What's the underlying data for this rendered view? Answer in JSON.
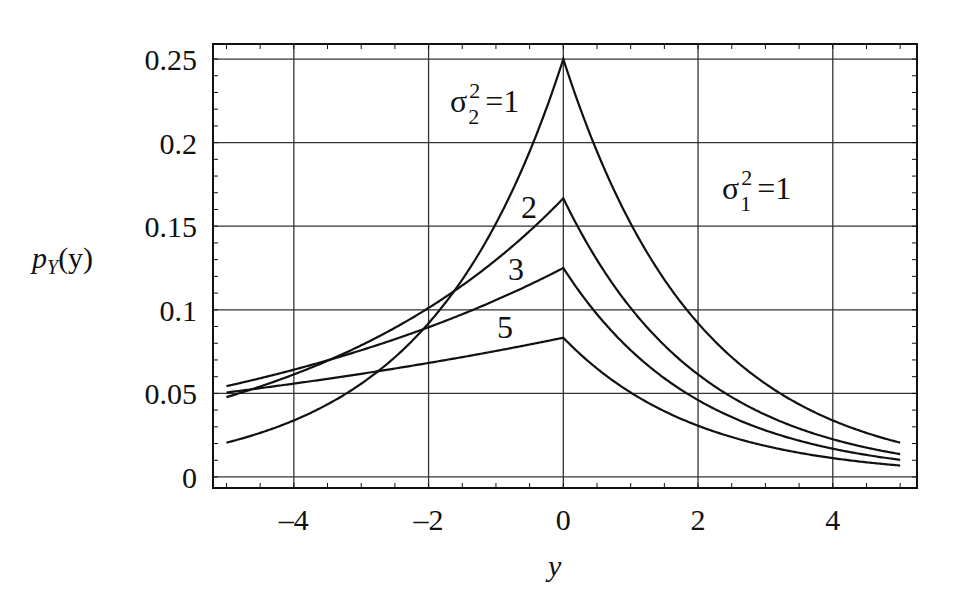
{
  "chart_data": {
    "type": "line",
    "title": "",
    "xlabel": "y",
    "ylabel": "p_Y(y)",
    "xlim": [
      -5.2,
      5.25
    ],
    "ylim": [
      -0.0066,
      0.259
    ],
    "grid": true,
    "x_ticks": [
      -4,
      -2,
      0,
      2,
      4
    ],
    "x_tick_labels": [
      "-4",
      "-2",
      "0",
      "2",
      "4"
    ],
    "y_ticks": [
      0,
      0.05,
      0.1,
      0.15,
      0.2,
      0.25
    ],
    "y_tick_labels": [
      "0",
      "0.05",
      "0.1",
      "0.15",
      "0.2",
      "0.25"
    ],
    "fixed_parameter": "σ1² = 1",
    "series": [
      {
        "name": "σ2² = 1",
        "sigma2_sq": 1,
        "label": "σ2² = 1",
        "peak": 0.25,
        "x": [
          -5,
          -4,
          -3,
          -2,
          -1,
          0,
          1,
          2,
          3,
          4,
          5
        ],
        "values": [
          0.0205,
          0.0338,
          0.0558,
          0.092,
          0.1516,
          0.25,
          0.1516,
          0.092,
          0.0558,
          0.0338,
          0.0205
        ]
      },
      {
        "name": "σ2² = 2",
        "sigma2_sq": 2,
        "label": "2",
        "peak": 0.1667,
        "x": [
          -5,
          -4,
          -3,
          -2,
          -1,
          0,
          1,
          2,
          3,
          4,
          5
        ],
        "values": [
          0.0478,
          0.0613,
          0.0787,
          0.101,
          0.1298,
          0.1667,
          0.1011,
          0.0613,
          0.0372,
          0.0226,
          0.0137
        ]
      },
      {
        "name": "σ2² = 3",
        "sigma2_sq": 3,
        "label": "3",
        "peak": 0.125,
        "x": [
          -5,
          -4,
          -3,
          -2,
          -1,
          0,
          1,
          2,
          3,
          4,
          5
        ],
        "values": [
          0.0544,
          0.0641,
          0.0758,
          0.0896,
          0.1058,
          0.125,
          0.0758,
          0.046,
          0.0279,
          0.0169,
          0.0103
        ]
      },
      {
        "name": "σ2² = 5",
        "sigma2_sq": 5,
        "label": "5",
        "peak": 0.0833,
        "x": [
          -5,
          -4,
          -3,
          -2,
          -1,
          0,
          1,
          2,
          3,
          4,
          5
        ],
        "values": [
          0.0505,
          0.0558,
          0.0617,
          0.0682,
          0.0754,
          0.0833,
          0.0505,
          0.0307,
          0.0186,
          0.0113,
          0.0068
        ]
      }
    ],
    "annotations": [
      {
        "text": "σ2² = 1",
        "x": -1.7,
        "y": 0.224
      },
      {
        "text": "2",
        "x": -0.5,
        "y": 0.163
      },
      {
        "text": "3",
        "x": -0.7,
        "y": 0.125
      },
      {
        "text": "5",
        "x": -0.9,
        "y": 0.088
      },
      {
        "text": "σ1² = 1",
        "x": 2.4,
        "y": 0.172
      }
    ],
    "legend_position": "none"
  },
  "labels": {
    "ylabel_main": "p",
    "ylabel_sub": "Y",
    "ylabel_arg": "(y)",
    "xlabel": "y",
    "sigma": "σ",
    "sub1": "1",
    "sub2": "2",
    "sup": "2",
    "eq1": "=1",
    "c2": "2",
    "c3": "3",
    "c5": "5"
  },
  "style": {
    "line_color": "#111111",
    "grid_color": "#333333"
  }
}
